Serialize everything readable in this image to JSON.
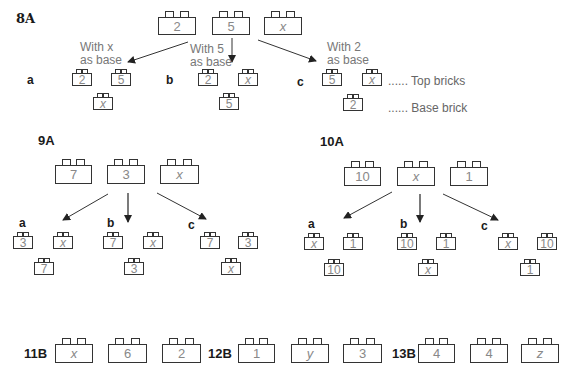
{
  "ex8A": {
    "label": "8A",
    "bricks": [
      "2",
      "5",
      "x"
    ],
    "notes": {
      "a": "With x\nas base",
      "a_line1": "With x",
      "a_line2": "as base",
      "b_line1": "With 5",
      "b_line2": "as base",
      "c_line1": "With 2",
      "c_line2": "as base"
    },
    "options": [
      {
        "letter": "a",
        "top": [
          "2",
          "5"
        ],
        "base": "x"
      },
      {
        "letter": "b",
        "top": [
          "2",
          "x"
        ],
        "base": "5"
      },
      {
        "letter": "c",
        "top": [
          "5",
          "x"
        ],
        "base": "2"
      }
    ],
    "legend": {
      "top": "...... Top bricks",
      "base": "...... Base brick"
    }
  },
  "ex9A": {
    "label": "9A",
    "bricks": [
      "7",
      "3",
      "x"
    ],
    "options": [
      {
        "letter": "a",
        "top": [
          "3",
          "x"
        ],
        "base": "7"
      },
      {
        "letter": "b",
        "top": [
          "7",
          "x"
        ],
        "base": "3"
      },
      {
        "letter": "c",
        "top": [
          "7",
          "3"
        ],
        "base": "x"
      }
    ]
  },
  "ex10A": {
    "label": "10A",
    "bricks": [
      "10",
      "x",
      "1"
    ],
    "options": [
      {
        "letter": "a",
        "top": [
          "x",
          "1"
        ],
        "base": "10"
      },
      {
        "letter": "b",
        "top": [
          "10",
          "1"
        ],
        "base": "x"
      },
      {
        "letter": "c",
        "top": [
          "x",
          "10"
        ],
        "base": "1"
      }
    ]
  },
  "bottom": [
    {
      "label": "11B",
      "bricks": [
        "x",
        "6",
        "2"
      ]
    },
    {
      "label": "12B",
      "bricks": [
        "1",
        "y",
        "3"
      ]
    },
    {
      "label": "13B",
      "bricks": [
        "4",
        "4",
        "z"
      ]
    }
  ]
}
